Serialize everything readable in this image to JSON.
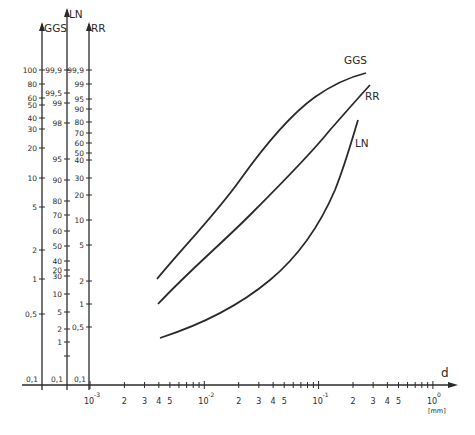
{
  "chart_data": {
    "type": "line",
    "title": "",
    "xlabel": "d",
    "xunit": "[mm]",
    "xscale": "log",
    "xlim": [
      0.001,
      1
    ],
    "x_ticks": [
      {
        "label_base": "10",
        "label_exp": "-3",
        "value": 0.001
      },
      {
        "label": "2",
        "value": 0.002
      },
      {
        "label": "3",
        "value": 0.003
      },
      {
        "label": "4",
        "value": 0.004
      },
      {
        "label": "5",
        "value": 0.005
      },
      {
        "label_base": "10",
        "label_exp": "-2",
        "value": 0.01
      },
      {
        "label": "2",
        "value": 0.02
      },
      {
        "label": "3",
        "value": 0.03
      },
      {
        "label": "4",
        "value": 0.04
      },
      {
        "label": "5",
        "value": 0.05
      },
      {
        "label_base": "10",
        "label_exp": "-1",
        "value": 0.1
      },
      {
        "label": "2",
        "value": 0.2
      },
      {
        "label": "3",
        "value": 0.3
      },
      {
        "label": "4",
        "value": 0.4
      },
      {
        "label": "5",
        "value": 0.5
      },
      {
        "label_base": "10",
        "label_exp": "0",
        "value": 1
      }
    ],
    "y_axes": [
      {
        "name": "GGS",
        "scale": "Gates-Gaudin-Schuhmann (log)",
        "ticks": [
          {
            "label": "100",
            "y": 70
          },
          {
            "label": "80",
            "y": 84
          },
          {
            "label": "60",
            "y": 98
          },
          {
            "label": "50",
            "y": 105
          },
          {
            "label": "40",
            "y": 118
          },
          {
            "label": "30",
            "y": 129
          },
          {
            "label": "20",
            "y": 148
          },
          {
            "label": "10",
            "y": 178
          },
          {
            "label": "5",
            "y": 207
          },
          {
            "label": "2",
            "y": 250
          },
          {
            "label": "1",
            "y": 279
          },
          {
            "label": "0,5",
            "y": 314
          }
        ],
        "bottom_label": "0,1"
      },
      {
        "name": "LN",
        "scale": "log-normal (probability)",
        "ticks": [
          {
            "label": "99,9",
            "y": 70
          },
          {
            "label": "99,5",
            "y": 93
          },
          {
            "label": "99",
            "y": 103
          },
          {
            "label": "98",
            "y": 123
          },
          {
            "label": "95",
            "y": 159
          },
          {
            "label": "90",
            "y": 180
          },
          {
            "label": "80",
            "y": 201
          },
          {
            "label": "70",
            "y": 215
          },
          {
            "label": "60",
            "y": 231
          },
          {
            "label": "50",
            "y": 246
          },
          {
            "label": "40",
            "y": 261
          },
          {
            "label": "30",
            "y": 276
          },
          {
            "label": "20",
            "y": 270
          },
          {
            "label": "10",
            "y": 294
          },
          {
            "label": "5",
            "y": 312
          },
          {
            "label": "2",
            "y": 329
          },
          {
            "label": "1",
            "y": 342
          },
          {
            "label": "",
            "y": 356
          }
        ],
        "bottom_label": "0,1"
      },
      {
        "name": "RR",
        "scale": "Rosin-Rammler",
        "ticks": [
          {
            "label": "99,9",
            "y": 70
          },
          {
            "label": "99",
            "y": 84
          },
          {
            "label": "95",
            "y": 99
          },
          {
            "label": "90",
            "y": 109
          },
          {
            "label": "80",
            "y": 122
          },
          {
            "label": "70",
            "y": 133
          },
          {
            "label": "60",
            "y": 143
          },
          {
            "label": "50",
            "y": 153
          },
          {
            "label": "40",
            "y": 160
          },
          {
            "label": "30",
            "y": 178
          },
          {
            "label": "20",
            "y": 195
          },
          {
            "label": "10",
            "y": 220
          },
          {
            "label": "5",
            "y": 245
          },
          {
            "label": "2",
            "y": 281
          },
          {
            "label": "1",
            "y": 304
          },
          {
            "label": "0,5",
            "y": 327
          }
        ],
        "bottom_label": "0,1"
      }
    ],
    "series": [
      {
        "name": "GGS",
        "label": "GGS",
        "points_d_mm": [
          0.004,
          0.01,
          0.02,
          0.05,
          0.1,
          0.2,
          0.27
        ],
        "points_value_pct": [
          2,
          7,
          18,
          45,
          70,
          90,
          99
        ]
      },
      {
        "name": "RR",
        "label": "RR",
        "points_d_mm": [
          0.004,
          0.01,
          0.02,
          0.05,
          0.1,
          0.2,
          0.3
        ],
        "points_value_pct": [
          1,
          5,
          15,
          40,
          65,
          90,
          99
        ]
      },
      {
        "name": "LN",
        "label": "LN",
        "points_d_mm": [
          0.004,
          0.01,
          0.02,
          0.05,
          0.1,
          0.15,
          0.22
        ],
        "points_value_pct": [
          1,
          3,
          8,
          30,
          70,
          90,
          99
        ]
      }
    ],
    "grid": false,
    "legend": "inline labels at curve ends"
  },
  "axis_titles": {
    "ggs": "GGS",
    "ln": "LN",
    "rr": "RR",
    "x": "d",
    "unit": "[mm]"
  },
  "curve_labels": {
    "ggs": "GGS",
    "rr": "RR",
    "ln": "LN"
  },
  "baseline_labels": [
    "0,1",
    "0,1",
    "0,1"
  ]
}
